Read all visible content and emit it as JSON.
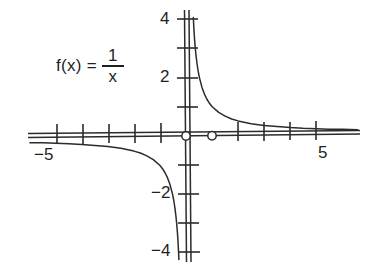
{
  "figure": {
    "background_color": "#ffffff",
    "ink_color": "#2b2b2b",
    "text_color": "#1f1f1f"
  },
  "equation": {
    "lhs": "f(x) =",
    "numerator": "1",
    "denominator": "x"
  },
  "axis_labels": {
    "x_negative_five": "−5",
    "x_positive_five": "5",
    "y_four": "4",
    "y_two": "2",
    "y_negative_two": "−2",
    "y_negative_four": "−4"
  },
  "chart_data": {
    "type": "line",
    "title": "",
    "subtitle": "",
    "xlabel": "",
    "ylabel": "",
    "annotations": [
      "f(x) = 1/x"
    ],
    "grid": false,
    "legend": "none",
    "function": "1/x",
    "xlim": [
      -6.1,
      6.9
    ],
    "ylim": [
      -4.5,
      4.6
    ],
    "x_ticks": [
      -5,
      -4,
      -3,
      -2,
      -1,
      0,
      1,
      2,
      3,
      4,
      5
    ],
    "x_tick_labels": [
      "−5",
      "",
      "",
      "",
      "",
      "",
      "",
      "",
      "",
      "",
      "5"
    ],
    "y_ticks": [
      -4,
      -3,
      -2,
      -1,
      1,
      2,
      3,
      4
    ],
    "y_tick_labels": [
      "−4",
      "",
      "−2",
      "",
      "",
      "2",
      "",
      "4"
    ],
    "open_points": [
      {
        "x": 0,
        "y": 0,
        "label": "origin-open-circle"
      },
      {
        "x": 1,
        "y": 0,
        "label": "unit-open-circle"
      }
    ],
    "series": [
      {
        "name": "branch-quadrant-I",
        "points": [
          {
            "x": 0.245,
            "y": 4.08
          },
          {
            "x": 0.26,
            "y": 3.85
          },
          {
            "x": 0.28,
            "y": 3.57
          },
          {
            "x": 0.3,
            "y": 3.33
          },
          {
            "x": 0.33,
            "y": 3.03
          },
          {
            "x": 0.36,
            "y": 2.78
          },
          {
            "x": 0.4,
            "y": 2.5
          },
          {
            "x": 0.45,
            "y": 2.22
          },
          {
            "x": 0.5,
            "y": 2.0
          },
          {
            "x": 0.6,
            "y": 1.67
          },
          {
            "x": 0.7,
            "y": 1.43
          },
          {
            "x": 0.8,
            "y": 1.25
          },
          {
            "x": 0.9,
            "y": 1.11
          },
          {
            "x": 1.0,
            "y": 1.0
          },
          {
            "x": 1.25,
            "y": 0.8
          },
          {
            "x": 1.5,
            "y": 0.67
          },
          {
            "x": 1.75,
            "y": 0.57
          },
          {
            "x": 2.0,
            "y": 0.5
          },
          {
            "x": 2.5,
            "y": 0.4
          },
          {
            "x": 3.0,
            "y": 0.33
          },
          {
            "x": 3.5,
            "y": 0.29
          },
          {
            "x": 4.0,
            "y": 0.25
          },
          {
            "x": 4.5,
            "y": 0.22
          },
          {
            "x": 5.0,
            "y": 0.2
          },
          {
            "x": 5.5,
            "y": 0.18
          },
          {
            "x": 6.0,
            "y": 0.17
          },
          {
            "x": 6.6,
            "y": 0.15
          }
        ]
      },
      {
        "name": "branch-quadrant-III",
        "points": [
          {
            "x": -6.0,
            "y": -0.17
          },
          {
            "x": -5.5,
            "y": -0.18
          },
          {
            "x": -5.0,
            "y": -0.2
          },
          {
            "x": -4.5,
            "y": -0.22
          },
          {
            "x": -4.0,
            "y": -0.25
          },
          {
            "x": -3.5,
            "y": -0.29
          },
          {
            "x": -3.0,
            "y": -0.33
          },
          {
            "x": -2.5,
            "y": -0.4
          },
          {
            "x": -2.0,
            "y": -0.5
          },
          {
            "x": -1.75,
            "y": -0.57
          },
          {
            "x": -1.5,
            "y": -0.67
          },
          {
            "x": -1.25,
            "y": -0.8
          },
          {
            "x": -1.0,
            "y": -1.0
          },
          {
            "x": -0.9,
            "y": -1.11
          },
          {
            "x": -0.8,
            "y": -1.25
          },
          {
            "x": -0.7,
            "y": -1.43
          },
          {
            "x": -0.6,
            "y": -1.67
          },
          {
            "x": -0.5,
            "y": -2.0
          },
          {
            "x": -0.45,
            "y": -2.22
          },
          {
            "x": -0.4,
            "y": -2.5
          },
          {
            "x": -0.36,
            "y": -2.78
          },
          {
            "x": -0.33,
            "y": -3.03
          },
          {
            "x": -0.3,
            "y": -3.33
          },
          {
            "x": -0.28,
            "y": -3.57
          },
          {
            "x": -0.26,
            "y": -3.85
          },
          {
            "x": -0.245,
            "y": -4.08
          },
          {
            "x": -0.235,
            "y": -4.26
          }
        ]
      }
    ]
  }
}
